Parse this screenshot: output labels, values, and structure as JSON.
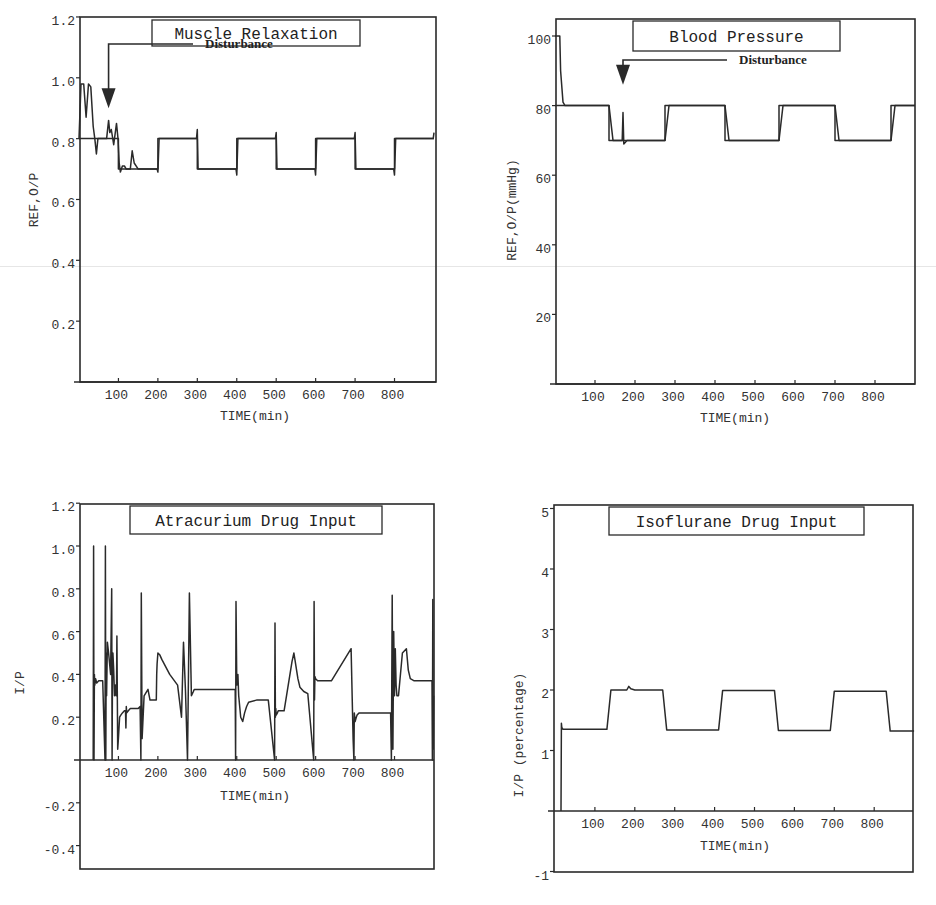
{
  "chart_data": [
    {
      "id": "muscle",
      "type": "line",
      "title": "Muscle Relaxation",
      "xlabel": "TIME(min)",
      "ylabel": "REF,O/P",
      "xlim": [
        0,
        900
      ],
      "ylim": [
        0,
        1.2
      ],
      "xticks": [
        100,
        200,
        300,
        400,
        500,
        600,
        700,
        800
      ],
      "xtick_labels": [
        "100",
        "200",
        "300",
        "400",
        "500",
        "600",
        "700",
        "800"
      ],
      "yticks": [
        0.2,
        0.4,
        0.6,
        0.8,
        1.0,
        1.2
      ],
      "ytick_labels": [
        "0.2",
        "0.4",
        "0.6",
        "0.8",
        "1.0",
        "1.2"
      ],
      "grid": false,
      "annotation": {
        "text": "Disturbance",
        "arrow_x": 75,
        "arrow_tip_y": 0.9
      },
      "series": [
        {
          "name": "REF",
          "x": [
            0,
            100,
            100,
            200,
            200,
            300,
            300,
            400,
            400,
            500,
            500,
            600,
            600,
            700,
            700,
            800,
            800,
            900
          ],
          "y": [
            0.8,
            0.8,
            0.7,
            0.7,
            0.8,
            0.8,
            0.7,
            0.7,
            0.8,
            0.8,
            0.7,
            0.7,
            0.8,
            0.8,
            0.7,
            0.7,
            0.8,
            0.8
          ]
        },
        {
          "name": "O/P",
          "x": [
            0,
            5,
            12,
            18,
            24,
            30,
            36,
            40,
            44,
            48,
            55,
            62,
            70,
            75,
            78,
            82,
            88,
            95,
            99,
            102,
            105,
            110,
            115,
            120,
            130,
            135,
            140,
            150,
            160,
            198,
            200,
            203,
            206,
            298,
            300,
            302,
            305,
            398,
            400,
            403,
            406,
            498,
            500,
            502,
            505,
            598,
            600,
            603,
            606,
            698,
            700,
            702,
            705,
            798,
            800,
            803,
            806,
            898,
            900
          ],
          "y": [
            0.8,
            0.98,
            0.98,
            0.87,
            0.98,
            0.97,
            0.84,
            0.8,
            0.75,
            0.8,
            0.8,
            0.8,
            0.8,
            0.86,
            0.82,
            0.83,
            0.78,
            0.85,
            0.8,
            0.72,
            0.69,
            0.71,
            0.71,
            0.7,
            0.7,
            0.76,
            0.72,
            0.7,
            0.7,
            0.7,
            0.69,
            0.8,
            0.8,
            0.8,
            0.83,
            0.7,
            0.7,
            0.7,
            0.68,
            0.8,
            0.8,
            0.8,
            0.82,
            0.7,
            0.7,
            0.7,
            0.68,
            0.8,
            0.8,
            0.8,
            0.82,
            0.7,
            0.7,
            0.7,
            0.68,
            0.8,
            0.8,
            0.8,
            0.82
          ]
        }
      ]
    },
    {
      "id": "bp",
      "type": "line",
      "title": "Blood Pressure",
      "xlabel": "TIME(min)",
      "ylabel": "REF,O/P(mmHg)",
      "xlim": [
        0,
        900
      ],
      "ylim": [
        0,
        105
      ],
      "xticks": [
        100,
        200,
        300,
        400,
        500,
        600,
        700,
        800
      ],
      "xtick_labels": [
        "100",
        "200",
        "300",
        "400",
        "500",
        "600",
        "700",
        "800"
      ],
      "yticks": [
        20,
        40,
        60,
        80,
        100
      ],
      "ytick_labels": [
        "20",
        "40",
        "60",
        "80",
        "100"
      ],
      "grid": false,
      "annotation": {
        "text": "Disturbance",
        "arrow_x": 170,
        "arrow_tip_y": 86
      },
      "series": [
        {
          "name": "REF",
          "x": [
            0,
            135,
            135,
            275,
            275,
            425,
            425,
            560,
            560,
            700,
            700,
            840,
            840,
            900
          ],
          "y": [
            80,
            80,
            70,
            70,
            80,
            80,
            70,
            70,
            80,
            80,
            70,
            70,
            80,
            80
          ]
        },
        {
          "name": "O/P",
          "x": [
            0,
            12,
            14,
            20,
            25,
            135,
            145,
            168,
            170,
            172,
            180,
            275,
            285,
            425,
            435,
            560,
            570,
            700,
            710,
            840,
            850,
            900
          ],
          "y": [
            100,
            100,
            90,
            81,
            80,
            80,
            70,
            70,
            78,
            69,
            70,
            70,
            80,
            80,
            70,
            70,
            80,
            80,
            70,
            70,
            80,
            80
          ]
        }
      ]
    },
    {
      "id": "atracurium",
      "type": "line",
      "title": "Atracurium Drug Input",
      "xlabel": "TIME(min)",
      "ylabel": "I/P",
      "xlim": [
        0,
        900
      ],
      "ylim": [
        -0.5,
        1.2
      ],
      "xticks": [
        100,
        200,
        300,
        400,
        500,
        600,
        700,
        800
      ],
      "xtick_labels": [
        "100",
        "200",
        "300",
        "400",
        "500",
        "600",
        "700",
        "800"
      ],
      "yticks": [
        -0.4,
        -0.2,
        0.2,
        0.4,
        0.6,
        0.8,
        1.0,
        1.2
      ],
      "ytick_labels": [
        "-0.4",
        "-0.2",
        "0.2",
        "0.4",
        "0.6",
        "0.8",
        "1.0",
        "1.2"
      ],
      "grid": false,
      "series": [
        {
          "name": "I/P",
          "x": [
            36,
            37,
            38,
            39,
            40,
            42,
            45,
            50,
            60,
            66,
            67,
            68,
            69,
            70,
            72,
            75,
            80,
            83,
            84,
            85,
            86,
            88,
            90,
            92,
            94,
            95,
            96,
            98,
            100,
            103,
            106,
            110,
            115,
            118,
            119,
            120,
            121,
            125,
            130,
            140,
            150,
            155,
            157,
            158,
            160,
            165,
            175,
            178,
            179,
            180,
            185,
            190,
            196,
            197,
            198,
            200,
            205,
            210,
            230,
            250,
            260,
            265,
            270,
            275,
            280,
            285,
            290,
            292,
            293,
            294,
            295,
            298,
            300,
            305,
            320,
            340,
            380,
            395,
            396,
            397,
            398,
            400,
            403,
            405,
            410,
            415,
            420,
            425,
            430,
            450,
            480,
            496,
            497,
            498,
            499,
            500,
            503,
            505,
            510,
            520,
            540,
            545,
            550,
            555,
            560,
            570,
            580,
            595,
            596,
            597,
            598,
            600,
            605,
            610,
            640,
            690,
            695,
            697,
            698,
            700,
            703,
            705,
            710,
            720,
            760,
            790,
            792,
            794,
            796,
            798,
            800,
            802,
            804,
            806,
            810,
            820,
            830,
            835,
            840,
            850,
            860,
            880,
            895,
            896,
            897,
            898,
            899,
            900
          ],
          "y": [
            0,
            1.0,
            0,
            0.4,
            0.35,
            0.38,
            0.36,
            0.37,
            0.37,
            0,
            1.0,
            0,
            0.5,
            0.3,
            0.55,
            0.5,
            0.4,
            0.8,
            0,
            0.45,
            0.5,
            0.42,
            0.3,
            0.35,
            0.3,
            0.31,
            0.58,
            0.05,
            0.1,
            0.2,
            0.21,
            0.22,
            0.23,
            0.23,
            0.15,
            0.25,
            0.22,
            0.23,
            0.24,
            0.24,
            0.24,
            0.25,
            0,
            0.78,
            0.1,
            0.3,
            0.33,
            0.3,
            0.29,
            0.28,
            0.28,
            0.28,
            0.28,
            0.4,
            0.45,
            0.5,
            0.49,
            0.47,
            0.4,
            0.35,
            0.2,
            0.55,
            0.32,
            0,
            0.78,
            0.3,
            0.32,
            0.33,
            0.33,
            0.33,
            0.33,
            0.33,
            0.33,
            0.33,
            0.33,
            0.33,
            0.33,
            0.33,
            0.33,
            0,
            0.74,
            0.35,
            0.4,
            0.3,
            0.2,
            0.18,
            0.22,
            0.25,
            0.27,
            0.28,
            0.28,
            0,
            0.64,
            0.2,
            0.24,
            0.21,
            0.22,
            0.23,
            0.23,
            0.23,
            0.46,
            0.5,
            0.44,
            0.38,
            0.34,
            0.32,
            0.31,
            0,
            0.74,
            0.28,
            0.39,
            0.38,
            0.37,
            0.37,
            0.37,
            0.52,
            0.1,
            0,
            0.22,
            0.18,
            0.2,
            0.21,
            0.22,
            0.22,
            0.22,
            0.22,
            0,
            0.77,
            0.05,
            0.6,
            0.3,
            0.52,
            0.35,
            0.3,
            0.3,
            0.5,
            0.52,
            0.42,
            0.38,
            0.37,
            0.37,
            0.37,
            0.37,
            0,
            0.75,
            0.05,
            0.3
          ]
        }
      ]
    },
    {
      "id": "isoflurane",
      "type": "line",
      "title": "Isoflurane Drug Input",
      "xlabel": "TIME(min)",
      "ylabel": "I/P (percentage)",
      "xlim": [
        0,
        900
      ],
      "ylim": [
        -1,
        5
      ],
      "xticks": [
        100,
        200,
        300,
        400,
        500,
        600,
        700,
        800
      ],
      "xtick_labels": [
        "100",
        "200",
        "300",
        "400",
        "500",
        "600",
        "700",
        "800"
      ],
      "yticks": [
        -1,
        1,
        2,
        3,
        4,
        5
      ],
      "ytick_labels": [
        "-1",
        "1",
        "2",
        "3",
        "4",
        "5"
      ],
      "grid": false,
      "series": [
        {
          "name": "I/P",
          "x": [
            15,
            16,
            17,
            20,
            25,
            130,
            140,
            180,
            185,
            190,
            200,
            270,
            280,
            410,
            420,
            550,
            560,
            690,
            700,
            830,
            840,
            900
          ],
          "y": [
            0,
            1.45,
            1.38,
            1.35,
            1.35,
            1.35,
            2.0,
            2.0,
            2.06,
            2.02,
            2.0,
            2.0,
            1.34,
            1.34,
            1.99,
            1.99,
            1.33,
            1.33,
            1.98,
            1.98,
            1.32,
            1.32
          ]
        }
      ]
    }
  ]
}
